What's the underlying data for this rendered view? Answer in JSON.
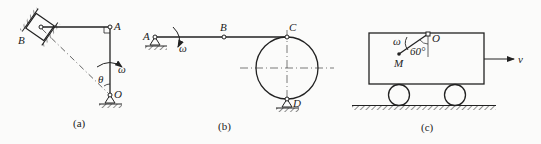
{
  "figure_a": {
    "caption": "(a)",
    "labels": {
      "A": "A",
      "B": "B",
      "O": "O",
      "theta": "θ",
      "omega": "ω"
    }
  },
  "figure_b": {
    "caption": "(b)",
    "labels": {
      "A": "A",
      "B": "B",
      "C": "C",
      "D": "D",
      "omega": "ω"
    }
  },
  "figure_c": {
    "caption": "(c)",
    "labels": {
      "O": "O",
      "M": "M",
      "omega": "ω",
      "angle": "60°",
      "v": "v"
    }
  },
  "colors": {
    "line": "#222222",
    "background": "#fbfbfa"
  }
}
